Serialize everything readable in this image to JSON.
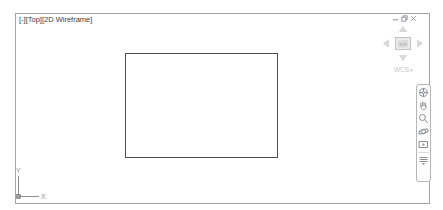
{
  "colors": {
    "viewport_border": "#a3a3a3",
    "object_line": "#4f4f4f",
    "ucs_line": "#8f8f8f",
    "label_text": "#3c3c3c",
    "faint_text": "#c6c6c6",
    "navbar_border": "#b6b6b6",
    "icon_gray": "#8b9096"
  },
  "viewport_controls": {
    "menu": "[-]",
    "view": "[Top]",
    "visual_style": "[2D Wireframe]"
  },
  "window_buttons": {
    "minimize": "minimize",
    "restore": "restore",
    "close": "close"
  },
  "viewcube": {
    "face_label": "TOP",
    "ucs_label": "WCS",
    "dropdown_glyph": "▾",
    "arrows": [
      "up",
      "left",
      "right",
      "down"
    ]
  },
  "navbar": {
    "tools": [
      {
        "name": "full-navigation-wheel",
        "label": "full-navigation-wheel"
      },
      {
        "name": "pan",
        "label": "pan"
      },
      {
        "name": "zoom-extents",
        "label": "zoom-extents"
      },
      {
        "name": "orbit",
        "label": "orbit"
      },
      {
        "name": "showmotion",
        "label": "showmotion"
      },
      {
        "name": "customize",
        "label": "customize"
      }
    ]
  },
  "ucs_icon": {
    "x_label": "X",
    "y_label": "Y"
  },
  "canvas_object": {
    "type": "rectangle"
  }
}
